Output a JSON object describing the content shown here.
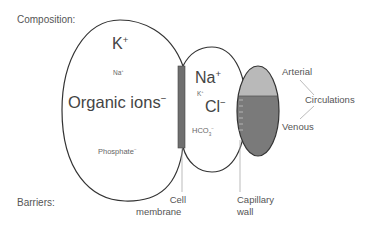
{
  "row_labels": {
    "composition": "Composition:",
    "barriers": "Barriers:"
  },
  "intracellular": {
    "k": "K",
    "k_charge": "+",
    "na": "Na",
    "na_charge": "+",
    "organic": "Organic ions",
    "organic_charge": "−",
    "phosphate": "Phosphate",
    "phosphate_charge": "−"
  },
  "interstitial": {
    "na": "Na",
    "na_charge": "+",
    "k": "K",
    "k_charge": "+",
    "cl": "Cl",
    "cl_charge": "−",
    "hco3": "HCO",
    "hco3_sub": "3",
    "hco3_charge": "−"
  },
  "circulation": {
    "arterial": "Arterial",
    "venous": "Venous",
    "circulations": "Circulations"
  },
  "barriers": {
    "cell_membrane_line1": "Cell",
    "cell_membrane_line2": "membrane",
    "capillary_wall_line1": "Capillary",
    "capillary_wall_line2": "wall"
  },
  "colors": {
    "outline": "#333333",
    "membrane": "#6f6f6f",
    "arterial": "#b9b9b9",
    "venous": "#7a7a7a",
    "leader": "#aaaaaa",
    "text": "#555555"
  }
}
